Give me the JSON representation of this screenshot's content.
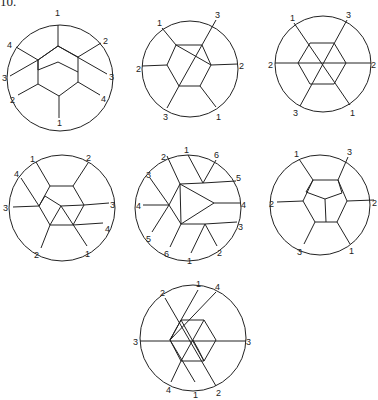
{
  "figure_number": "10.",
  "diagrams": [
    {
      "id": 1,
      "labels": [
        "1",
        "2",
        "3",
        "4",
        "1",
        "2",
        "3",
        "4"
      ]
    },
    {
      "id": 2,
      "labels": [
        "1",
        "3",
        "2",
        "1",
        "3",
        "2"
      ]
    },
    {
      "id": 3,
      "labels": [
        "1",
        "3",
        "2",
        "1",
        "3",
        "2"
      ]
    },
    {
      "id": 4,
      "labels": [
        "1",
        "2",
        "3",
        "4",
        "1",
        "2",
        "3",
        "4"
      ]
    },
    {
      "id": 5,
      "labels": [
        "1",
        "6",
        "5",
        "4",
        "3",
        "2",
        "1",
        "6",
        "5",
        "4",
        "3",
        "2"
      ]
    },
    {
      "id": 6,
      "labels": [
        "1",
        "3",
        "2",
        "1",
        "3",
        "2"
      ]
    },
    {
      "id": 7,
      "labels": [
        "1",
        "4",
        "3",
        "2",
        "1",
        "4",
        "3",
        "2"
      ]
    }
  ]
}
